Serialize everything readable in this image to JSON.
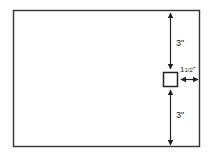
{
  "diagram": {
    "title": "",
    "outer_rect": {
      "label": "page"
    },
    "marker": {
      "label": "square"
    },
    "dimensions": {
      "top": "3\"",
      "bottom": "3\"",
      "right_whole": "1",
      "right_frac": "1/2",
      "right_unit": "\""
    },
    "colors": {
      "stroke": "#222222",
      "background": "#ffffff"
    }
  }
}
